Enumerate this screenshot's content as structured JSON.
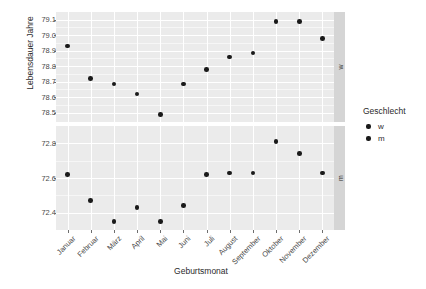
{
  "chart_data": {
    "type": "scatter",
    "title": "",
    "xlabel": "Geburtsmonat",
    "ylabel": "Lebensdauer Jahre",
    "legend_title": "Geschlecht",
    "legend_position": "right",
    "grid": true,
    "facet": {
      "variable": "Geschlecht",
      "position": "right",
      "levels": [
        "w",
        "m"
      ]
    },
    "categories": [
      "Januar",
      "Februar",
      "März",
      "April",
      "Mai",
      "Juni",
      "Juli",
      "August",
      "September",
      "Oktober",
      "November",
      "Dezember"
    ],
    "panels": [
      {
        "id": "w",
        "strip_label": "w",
        "legend_label": "w",
        "ylim": [
          78.44,
          79.15
        ],
        "yticks": [
          "79.1",
          "79.0",
          "78.9",
          "78.8",
          "78.7",
          "78.6",
          "78.5"
        ],
        "ytick_values": [
          79.1,
          79.0,
          78.9,
          78.8,
          78.7,
          78.6,
          78.5
        ],
        "values": [
          78.93,
          78.72,
          78.685,
          78.62,
          78.49,
          78.685,
          78.78,
          78.86,
          78.885,
          79.09,
          79.09,
          78.98
        ]
      },
      {
        "id": "m",
        "strip_label": "m",
        "legend_label": "m",
        "ylim": [
          72.3,
          72.9
        ],
        "yticks": [
          "72.8",
          "72.6",
          "72.4"
        ],
        "ytick_values": [
          72.8,
          72.6,
          72.4
        ],
        "values": [
          72.62,
          72.47,
          72.35,
          72.43,
          72.35,
          72.44,
          72.62,
          72.63,
          72.63,
          72.81,
          72.74,
          72.63
        ]
      }
    ],
    "series": [
      {
        "name": "w",
        "x": [
          "Januar",
          "Februar",
          "März",
          "April",
          "Mai",
          "Juni",
          "Juli",
          "August",
          "September",
          "Oktober",
          "November",
          "Dezember"
        ],
        "values": [
          78.93,
          78.72,
          78.685,
          78.62,
          78.49,
          78.685,
          78.78,
          78.86,
          78.885,
          79.09,
          79.09,
          78.98
        ]
      },
      {
        "name": "m",
        "x": [
          "Januar",
          "Februar",
          "März",
          "April",
          "Mai",
          "Juni",
          "Juli",
          "August",
          "September",
          "Oktober",
          "November",
          "Dezember"
        ],
        "values": [
          72.62,
          72.47,
          72.35,
          72.43,
          72.35,
          72.44,
          72.62,
          72.63,
          72.63,
          72.81,
          72.74,
          72.63
        ]
      }
    ],
    "colors": {
      "point": "#1a1a1a",
      "panel_background": "#ebebeb",
      "grid_major": "#ffffff",
      "grid_minor": "#f6f6f6",
      "strip_background": "#d5d5d5",
      "plot_background": "#ffffff",
      "text": "#2b2b2b"
    }
  },
  "legend": {
    "title": "Geschlecht",
    "items": [
      {
        "label": "w"
      },
      {
        "label": "m"
      }
    ]
  }
}
